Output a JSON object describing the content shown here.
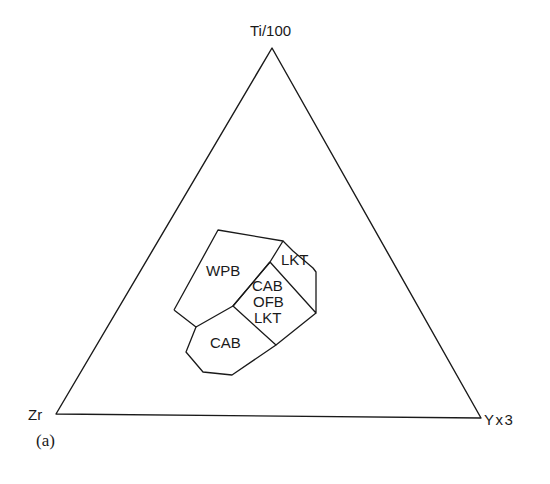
{
  "diagram": {
    "type": "ternary",
    "caption": "(a)",
    "vertices": {
      "top": {
        "label": "Ti/100"
      },
      "left": {
        "label": "Zr"
      },
      "right": {
        "label": "Yx3"
      }
    },
    "fields": [
      {
        "id": "wpb",
        "label": "WPB"
      },
      {
        "id": "lkt",
        "label": "LKT"
      },
      {
        "id": "cab_ofb_lkt",
        "lines": [
          "CAB",
          "OFB",
          "LKT"
        ]
      },
      {
        "id": "cab",
        "label": "CAB"
      }
    ],
    "colors": {
      "stroke": "#1a1a1a",
      "background": "#ffffff"
    }
  }
}
